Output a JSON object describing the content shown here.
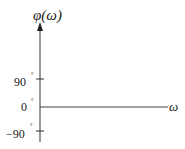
{
  "diagram": {
    "type": "phase-frequency-axes",
    "y_axis_label": "φ(ω)",
    "x_axis_label": "ω",
    "y_ticks": [
      {
        "label": "90",
        "unit": "°",
        "y": 79
      },
      {
        "label": "0",
        "unit": "°",
        "y": 107
      },
      {
        "label": "−90",
        "unit": "°",
        "y": 131
      }
    ],
    "line_color": "#333333",
    "curve": "horizontal line at 0°"
  }
}
